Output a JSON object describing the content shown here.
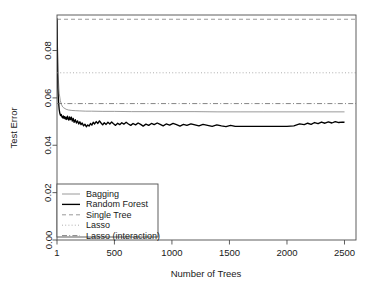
{
  "chart_data": {
    "type": "line",
    "title": "",
    "xlabel": "Number of Trees",
    "ylabel": "Test Error",
    "xlim": [
      1,
      2600
    ],
    "ylim": [
      0.0,
      0.095
    ],
    "grid": false,
    "legend_position": "bottom-left",
    "xticks": [
      1,
      500,
      1000,
      1500,
      2000,
      2500
    ],
    "xtick_labels": [
      "1",
      "500",
      "1000",
      "1500",
      "2000",
      "2500"
    ],
    "yticks": [
      0.0,
      0.02,
      0.04,
      0.06,
      0.08
    ],
    "ytick_labels": [
      "0.00",
      "0.02",
      "0.04",
      "0.06",
      "0.08"
    ],
    "series": [
      {
        "name": "Bagging",
        "style": "solid",
        "color": "#808080",
        "width": 0.8,
        "x": [
          1,
          10,
          20,
          30,
          40,
          50,
          60,
          80,
          100,
          130,
          160,
          200,
          250,
          300,
          400,
          500,
          650,
          800,
          1000,
          1200,
          1400,
          1600,
          1800,
          2000,
          2200,
          2400,
          2500
        ],
        "values": [
          0.0935,
          0.07,
          0.062,
          0.0588,
          0.0572,
          0.0562,
          0.0558,
          0.0552,
          0.0549,
          0.0547,
          0.0546,
          0.0545,
          0.0544,
          0.0544,
          0.0543,
          0.0543,
          0.0542,
          0.0542,
          0.0542,
          0.0542,
          0.0541,
          0.0541,
          0.0541,
          0.0541,
          0.0541,
          0.0541,
          0.0541
        ]
      },
      {
        "name": "Random Forest",
        "style": "solid",
        "color": "#000000",
        "width": 1.35,
        "x": [
          1,
          8,
          14,
          20,
          26,
          32,
          38,
          44,
          50,
          56,
          62,
          68,
          74,
          80,
          86,
          92,
          98,
          104,
          110,
          118,
          126,
          134,
          142,
          150,
          160,
          170,
          180,
          190,
          200,
          210,
          220,
          232,
          244,
          256,
          268,
          280,
          292,
          304,
          316,
          328,
          342,
          356,
          370,
          384,
          398,
          412,
          428,
          444,
          460,
          476,
          492,
          510,
          528,
          546,
          564,
          582,
          602,
          622,
          642,
          662,
          684,
          706,
          728,
          750,
          774,
          798,
          822,
          846,
          872,
          898,
          924,
          950,
          980,
          1010,
          1040,
          1070,
          1100,
          1130,
          1165,
          1200,
          1235,
          1270,
          1310,
          1350,
          1390,
          1430,
          1470,
          1510,
          1550,
          1600,
          1650,
          1700,
          1760,
          1820,
          1880,
          1940,
          2000,
          2060,
          2110,
          2150,
          2180,
          2210,
          2240,
          2270,
          2300,
          2330,
          2360,
          2390,
          2420,
          2450,
          2480,
          2500
        ],
        "values": [
          0.0935,
          0.0642,
          0.0586,
          0.0551,
          0.0534,
          0.0525,
          0.053,
          0.052,
          0.0516,
          0.0524,
          0.0514,
          0.0521,
          0.0511,
          0.0518,
          0.0509,
          0.0523,
          0.0512,
          0.0506,
          0.052,
          0.0508,
          0.0519,
          0.0502,
          0.0513,
          0.0497,
          0.0508,
          0.0494,
          0.0503,
          0.049,
          0.0499,
          0.0487,
          0.0494,
          0.0482,
          0.0489,
          0.0478,
          0.0486,
          0.0481,
          0.0492,
          0.0485,
          0.0497,
          0.049,
          0.05,
          0.0492,
          0.0503,
          0.0494,
          0.0486,
          0.0495,
          0.0488,
          0.0497,
          0.049,
          0.0498,
          0.0491,
          0.0484,
          0.0493,
          0.0487,
          0.0495,
          0.0489,
          0.0497,
          0.049,
          0.0484,
          0.0492,
          0.0486,
          0.0494,
          0.0488,
          0.0481,
          0.0489,
          0.0484,
          0.0492,
          0.0487,
          0.0494,
          0.0488,
          0.0482,
          0.049,
          0.0485,
          0.0492,
          0.0487,
          0.0481,
          0.0488,
          0.0484,
          0.049,
          0.0486,
          0.0482,
          0.0488,
          0.0484,
          0.048,
          0.0486,
          0.0482,
          0.0479,
          0.0484,
          0.048,
          0.048,
          0.048,
          0.048,
          0.048,
          0.048,
          0.048,
          0.048,
          0.048,
          0.0482,
          0.049,
          0.0487,
          0.0493,
          0.0488,
          0.0496,
          0.0491,
          0.0498,
          0.0493,
          0.0499,
          0.0494,
          0.05,
          0.0496,
          0.0498,
          0.0497
        ]
      },
      {
        "name": "Single Tree",
        "style": "dashed",
        "color": "#808080",
        "width": 0.8,
        "constant": 0.0932
      },
      {
        "name": "Lasso",
        "style": "dotted",
        "color": "#999999",
        "width": 0.8,
        "constant": 0.0706
      },
      {
        "name": "Lasso (interaction)",
        "style": "dashdot",
        "color": "#666666",
        "width": 0.8,
        "constant": 0.0576
      }
    ]
  },
  "legend": {
    "items": [
      {
        "label": "Bagging"
      },
      {
        "label": "Random Forest"
      },
      {
        "label": "Single Tree"
      },
      {
        "label": "Lasso"
      },
      {
        "label": "Lasso (interaction)"
      }
    ]
  }
}
